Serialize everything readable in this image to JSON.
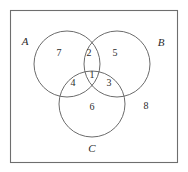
{
  "figure": {
    "type": "venn-diagram",
    "sets_count": 3,
    "universe_box": {
      "x": 10,
      "y": 10,
      "width": 168,
      "height": 153,
      "stroke_color": "#6e6e6e"
    },
    "circle_stroke_color": "#5a5a5a",
    "text_color": "#2b2b2b",
    "background_color": "#ffffff"
  },
  "chart_data": {
    "type": "venn",
    "title": "",
    "set_labels": [
      "A",
      "B",
      "C"
    ],
    "region_labels": [
      "1",
      "2",
      "3",
      "4",
      "5",
      "6",
      "7",
      "8"
    ],
    "regions": [
      {
        "id": "A-only",
        "label": "7",
        "sets": [
          "A"
        ],
        "x": 59,
        "y": 54
      },
      {
        "id": "A-and-B",
        "label": "2",
        "sets": [
          "A",
          "B"
        ],
        "x": 89,
        "y": 54
      },
      {
        "id": "B-only",
        "label": "5",
        "sets": [
          "B"
        ],
        "x": 115,
        "y": 54
      },
      {
        "id": "A-B-C",
        "label": "1",
        "sets": [
          "A",
          "B",
          "C"
        ],
        "x": 92,
        "y": 76
      },
      {
        "id": "A-and-C",
        "label": "4",
        "sets": [
          "A",
          "C"
        ],
        "x": 73,
        "y": 84
      },
      {
        "id": "B-and-C",
        "label": "3",
        "sets": [
          "B",
          "C"
        ],
        "x": 109,
        "y": 84
      },
      {
        "id": "C-only",
        "label": "6",
        "sets": [
          "C"
        ],
        "x": 92,
        "y": 108
      },
      {
        "id": "outside-all",
        "label": "8",
        "sets": [],
        "x": 146,
        "y": 107
      }
    ],
    "circles": [
      {
        "name": "A",
        "cx": 67,
        "cy": 64,
        "r": 33,
        "label_x": 25,
        "label_y": 42
      },
      {
        "name": "B",
        "cx": 117,
        "cy": 64,
        "r": 33,
        "label_x": 161,
        "label_y": 43
      },
      {
        "name": "C",
        "cx": 92,
        "cy": 104,
        "r": 33,
        "label_x": 92,
        "label_y": 149
      }
    ]
  }
}
